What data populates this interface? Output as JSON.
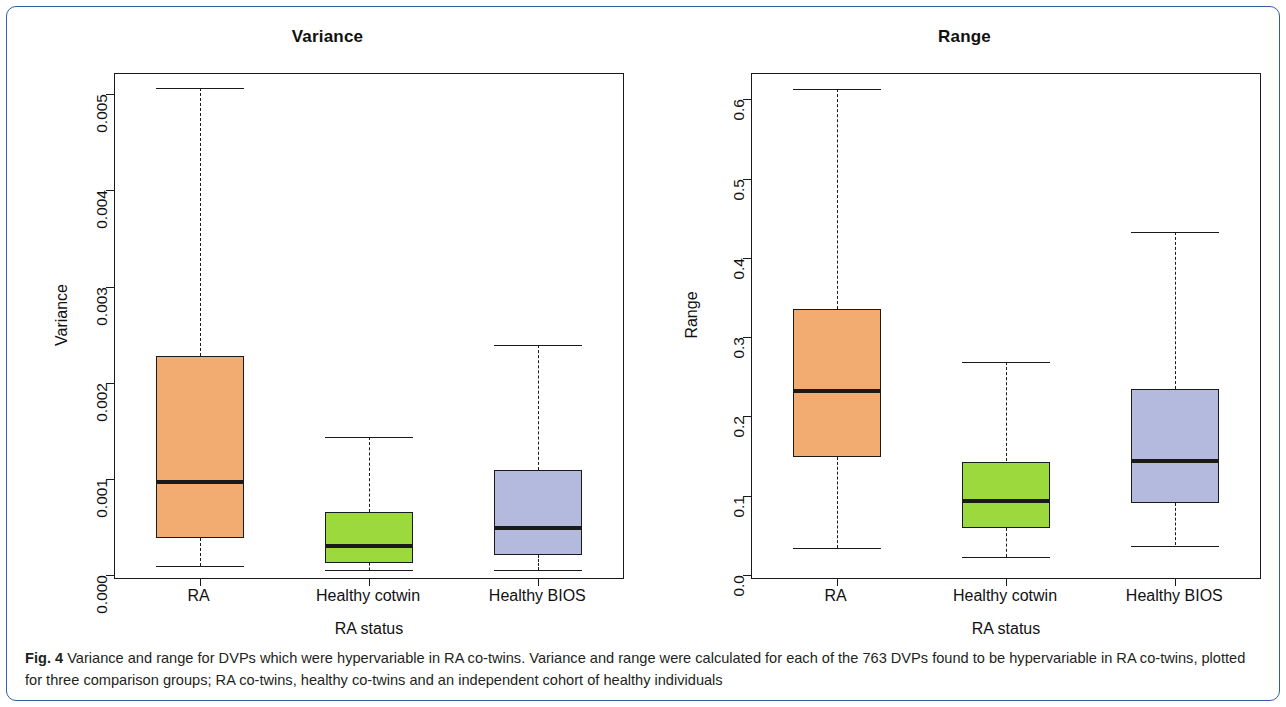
{
  "figure": {
    "caption_label": "Fig. 4",
    "caption_text": " Variance and range for DVPs which were hypervariable in RA co-twins. Variance and range were calculated for each of the 763 DVPs found to be hypervariable in RA co-twins, plotted for three comparison groups; RA co-twins, healthy co-twins and an independent cohort of healthy individuals"
  },
  "colors": {
    "orange": "#f2ac72",
    "green": "#9bd93c",
    "blue": "#b4b9de",
    "line": "#1a1a1a",
    "border": "#2e5fa3"
  },
  "chart_data": [
    {
      "type": "box",
      "panel": "left",
      "title": "Variance",
      "xlabel": "RA status",
      "ylabel": "Variance",
      "categories": [
        "RA",
        "Healthy cotwin",
        "Healthy BIOS"
      ],
      "ytick_labels": [
        "0.000",
        "0.001",
        "0.002",
        "0.003",
        "0.004",
        "0.005"
      ],
      "ytick_values": [
        0.0,
        0.001,
        0.002,
        0.003,
        0.004,
        0.005
      ],
      "ylim": [
        -3e-05,
        0.00521
      ],
      "grid": false,
      "legend": "none",
      "boxes": [
        {
          "label": "RA",
          "color": "#f2ac72",
          "min": 9e-05,
          "q1": 0.00039,
          "median": 0.00097,
          "q3": 0.00228,
          "max": 0.00506
        },
        {
          "label": "Healthy cotwin",
          "color": "#9bd93c",
          "min": 5e-05,
          "q1": 0.00013,
          "median": 0.0003,
          "q3": 0.00066,
          "max": 0.00144
        },
        {
          "label": "Healthy BIOS",
          "color": "#b4b9de",
          "min": 5e-05,
          "q1": 0.00021,
          "median": 0.00049,
          "q3": 0.00109,
          "max": 0.00239
        }
      ]
    },
    {
      "type": "box",
      "panel": "right",
      "title": "Range",
      "xlabel": "RA status",
      "ylabel": "Range",
      "categories": [
        "RA",
        "Healthy cotwin",
        "Healthy BIOS"
      ],
      "ytick_labels": [
        "0.0",
        "0.1",
        "0.2",
        "0.3",
        "0.4",
        "0.5",
        "0.6"
      ],
      "ytick_values": [
        0.0,
        0.1,
        0.2,
        0.3,
        0.4,
        0.5,
        0.6
      ],
      "ylim": [
        -0.004,
        0.632
      ],
      "grid": false,
      "legend": "none",
      "boxes": [
        {
          "label": "RA",
          "color": "#f2ac72",
          "min": 0.034,
          "q1": 0.149,
          "median": 0.232,
          "q3": 0.336,
          "max": 0.613
        },
        {
          "label": "Healthy cotwin",
          "color": "#9bd93c",
          "min": 0.022,
          "q1": 0.059,
          "median": 0.093,
          "q3": 0.143,
          "max": 0.268
        },
        {
          "label": "Healthy BIOS",
          "color": "#b4b9de",
          "min": 0.037,
          "q1": 0.091,
          "median": 0.144,
          "q3": 0.234,
          "max": 0.432
        }
      ]
    }
  ]
}
